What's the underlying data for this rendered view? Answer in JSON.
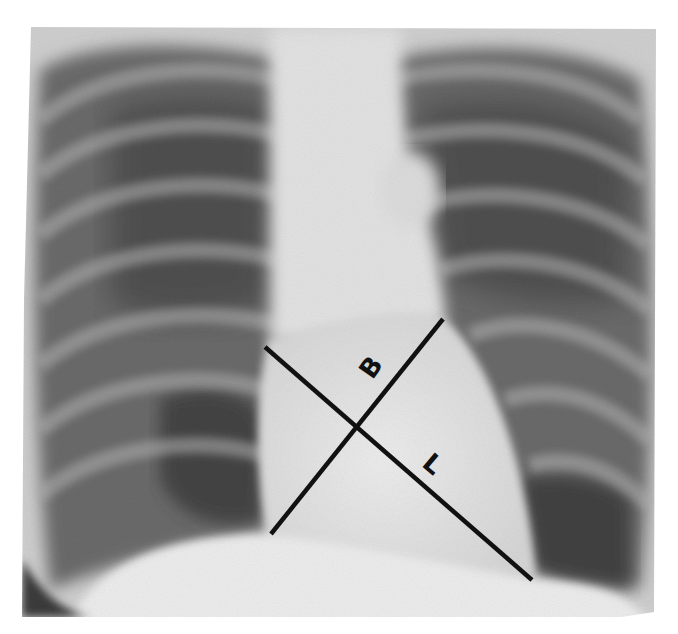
{
  "image": {
    "type": "chest-radiograph",
    "view": "PA chest X-ray",
    "description": "Frontal chest radiograph with two crossing measurement lines over the cardiac silhouette"
  },
  "annotations": {
    "lines": [
      {
        "id": "B",
        "label": "B",
        "meaning": "broad diameter",
        "x1": 271,
        "y1": 534,
        "x2": 443,
        "y2": 319
      },
      {
        "id": "L",
        "label": "L",
        "meaning": "long diameter",
        "x1": 265,
        "y1": 347,
        "x2": 532,
        "y2": 580
      }
    ],
    "labels": [
      {
        "text": "B",
        "x": 372,
        "y": 368,
        "rotate": -55
      },
      {
        "text": "L",
        "x": 432,
        "y": 465,
        "rotate": 40
      }
    ],
    "line_color": "#111111"
  },
  "colors": {
    "background": "#ffffff",
    "soft_tissue": "#e4e4e4",
    "lung": "#5a5a5a",
    "lung_dark": "#3c3c3c",
    "rib": "#a8a8a8",
    "heart": "#e8e8e8",
    "diaphragm": "#efefef"
  }
}
